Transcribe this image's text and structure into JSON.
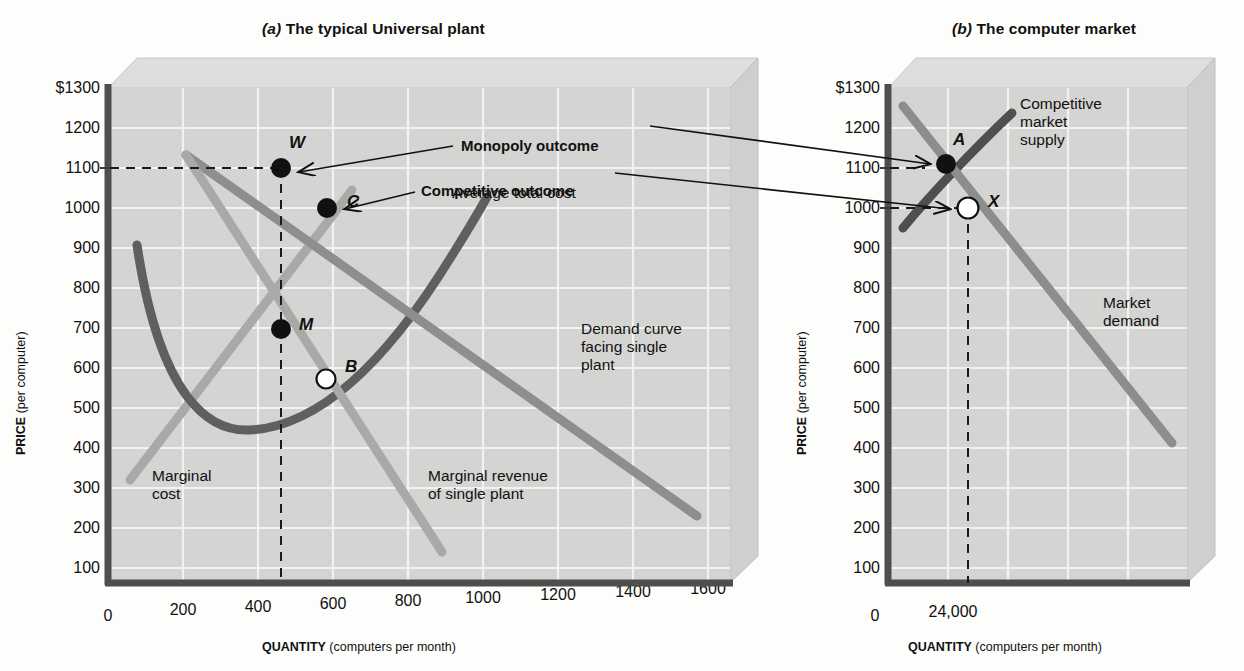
{
  "figure": {
    "panels": [
      {
        "id": "a",
        "tag": "(a)",
        "title": "The typical Universal plant",
        "axes": {
          "ytitle_bold": "PRICE",
          "ytitle_reg": " (per computer)",
          "xtitle_bold": "QUANTITY",
          "xtitle_reg": " (computers per month)",
          "yticks": [
            "$1300",
            "1200",
            "1100",
            "1000",
            "900",
            "800",
            "700",
            "600",
            "500",
            "400",
            "300",
            "200",
            "100"
          ],
          "xticks": [
            "0",
            "200",
            "400",
            "600",
            "800",
            "1000",
            "1200",
            "1400",
            "1600"
          ]
        },
        "curve_labels": {
          "atc": "Average total cost",
          "demand": "Demand curve\nfacing single\nplant",
          "marginal_cost": "Marginal\ncost",
          "marginal_revenue": "Marginal revenue\nof single plant"
        },
        "points": [
          {
            "label": "W",
            "filled": true,
            "q": 460,
            "p": 1100
          },
          {
            "label": "C",
            "filled": true,
            "q": 580,
            "p": 1000
          },
          {
            "label": "M",
            "filled": true,
            "q": 460,
            "p": 765
          },
          {
            "label": "B",
            "filled": false,
            "q": 580,
            "p": 565
          }
        ]
      },
      {
        "id": "b",
        "tag": "(b)",
        "title": "The computer market",
        "axes": {
          "ytitle_bold": "PRICE",
          "ytitle_reg": " (per computer)",
          "xtitle_bold": "QUANTITY",
          "xtitle_reg": " (computers per month)",
          "yticks": [
            "$1300",
            "1200",
            "1100",
            "1000",
            "900",
            "800",
            "700",
            "600",
            "500",
            "400",
            "300",
            "200",
            "100"
          ],
          "xticks": [
            "0",
            "24,000"
          ]
        },
        "curve_labels": {
          "supply": "Competitive\nmarket\nsupply",
          "demand": "Market\ndemand"
        },
        "points": [
          {
            "label": "A",
            "filled": true,
            "p": 1100
          },
          {
            "label": "X",
            "filled": false,
            "p": 1000
          }
        ]
      }
    ],
    "callouts": [
      {
        "id": "monopoly",
        "label": "Monopoly outcome",
        "targets": [
          "W",
          "A"
        ]
      },
      {
        "id": "competitive",
        "label": "Competitive outcome",
        "targets": [
          "C",
          "X"
        ]
      }
    ],
    "colors": {
      "plot_face": "#d3d3d3",
      "plot_top_face": "#dfdfdf",
      "grid": "#f2f2f2",
      "axis": "#4a4a4a",
      "atc_curve": "#5e5e5e",
      "light_curve": "#a8a8a8",
      "demand_curve": "#8e8e8e",
      "supply_curve": "#4f4f4f",
      "point_fill": "#111111",
      "point_open": "#ffffff"
    }
  }
}
